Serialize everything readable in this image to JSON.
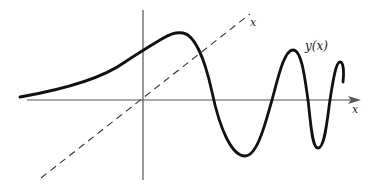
{
  "diagram": {
    "labels": {
      "x_axis": "x",
      "diagonal_line": "x",
      "curve": "y(x)"
    },
    "colors": {
      "axes": "#555555",
      "curve": "#111111",
      "dashed": "#333333",
      "background": "#ffffff"
    },
    "elements": [
      {
        "name": "x-axis",
        "style": "solid thin line with arrow"
      },
      {
        "name": "y-axis",
        "style": "solid thin vertical line"
      },
      {
        "name": "diagonal-line-y-equals-x",
        "style": "dashed"
      },
      {
        "name": "curve-y-of-x",
        "style": "thick solid, oscillates with growing frequency"
      }
    ]
  }
}
